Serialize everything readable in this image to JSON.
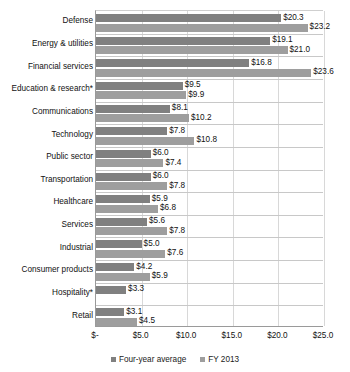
{
  "chart_data": {
    "type": "bar",
    "orientation": "horizontal",
    "title": "",
    "subtitle": "",
    "xlabel": "",
    "ylabel": "",
    "xlim": [
      0,
      25
    ],
    "grid": true,
    "legend_position": "bottom",
    "categories": [
      "Defense",
      "Energy & utilities",
      "Financial services",
      "Education & research*",
      "Communications",
      "Technology",
      "Public sector",
      "Transportation",
      "Healthcare",
      "Services",
      "Industrial",
      "Consumer products",
      "Hospitality*",
      "Retail"
    ],
    "tick_labels": [
      "$-",
      "$5.0",
      "$10.0",
      "$15.0",
      "$20.0",
      "$25.0"
    ],
    "tick_values": [
      0,
      5,
      10,
      15,
      20,
      25
    ],
    "series": [
      {
        "name": "Four-year average",
        "color": "#808080",
        "values": [
          20.3,
          19.1,
          16.8,
          9.5,
          8.1,
          7.8,
          6.0,
          6.0,
          5.9,
          5.6,
          5.0,
          4.2,
          3.3,
          3.1
        ],
        "labels": [
          "$20.3",
          "$19.1",
          "$16.8",
          "$9.5",
          "$8.1",
          "$7.8",
          "$6.0",
          "$6.0",
          "$5.9",
          "$5.6",
          "$5.0",
          "$4.2",
          "$3.3",
          "$3.1"
        ]
      },
      {
        "name": "FY 2013",
        "color": "#9e9e9e",
        "values": [
          23.2,
          21.0,
          23.6,
          9.9,
          10.2,
          10.8,
          7.4,
          7.8,
          6.8,
          7.8,
          7.6,
          5.9,
          null,
          4.5
        ],
        "labels": [
          "$23.2",
          "$21.0",
          "$23.6",
          "$9.9",
          "$10.2",
          "$10.8",
          "$7.4",
          "$7.8",
          "$6.8",
          "$7.8",
          "$7.6",
          "$5.9",
          "",
          "$4.5"
        ]
      }
    ]
  },
  "legend": {
    "items": [
      {
        "label": "Four-year average"
      },
      {
        "label": "FY 2013"
      }
    ]
  }
}
